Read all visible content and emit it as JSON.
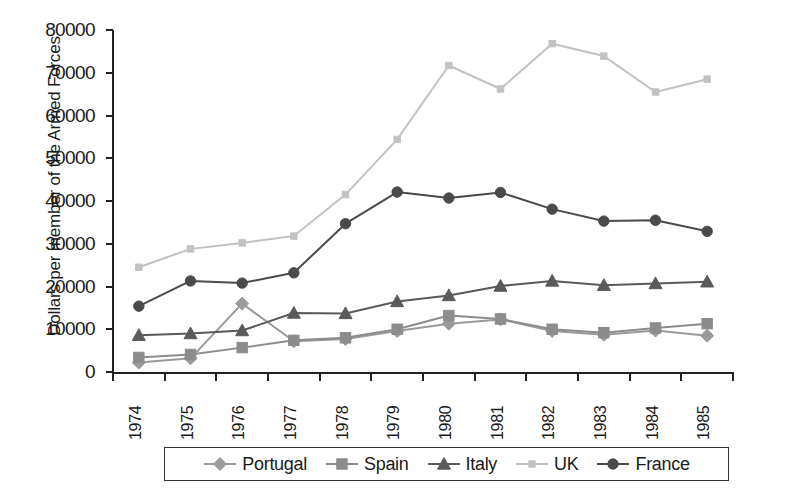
{
  "chart_data": {
    "type": "line",
    "title": "",
    "xlabel": "",
    "ylabel": "Dollars per member of the Armed Forces",
    "categories": [
      "1974",
      "1975",
      "1976",
      "1977",
      "1978",
      "1979",
      "1980",
      "1981",
      "1982",
      "1983",
      "1984",
      "1985"
    ],
    "ylim": [
      0,
      80000
    ],
    "ytick_labels": [
      "80000",
      "70000",
      "60000",
      "50000",
      "40000",
      "30000",
      "20000",
      "10000",
      "0"
    ],
    "ytick_values": [
      80000,
      70000,
      60000,
      50000,
      40000,
      30000,
      20000,
      10000,
      0
    ],
    "grid": false,
    "legend_position": "bottom",
    "series": [
      {
        "name": "Portugal",
        "marker": "diamond",
        "color": "#9a9a9a",
        "values": [
          2200,
          3200,
          16000,
          7200,
          7700,
          9600,
          11300,
          12300,
          9600,
          8700,
          9700,
          8500
        ]
      },
      {
        "name": "Spain",
        "marker": "square",
        "color": "#8c8c8c",
        "values": [
          3400,
          4100,
          5700,
          7400,
          8000,
          10000,
          13200,
          12400,
          10000,
          9200,
          10300,
          11300
        ]
      },
      {
        "name": "Italy",
        "marker": "triangle",
        "color": "#5a5a5a",
        "values": [
          8600,
          9000,
          9700,
          13800,
          13700,
          16500,
          17900,
          20100,
          21300,
          20300,
          20700,
          21100
        ]
      },
      {
        "name": "UK",
        "marker": "square",
        "color": "#c2c2c2",
        "values": [
          24500,
          28800,
          30200,
          31800,
          41500,
          54400,
          71700,
          66200,
          76800,
          73900,
          65500,
          68500
        ]
      },
      {
        "name": "France",
        "marker": "circle",
        "color": "#4a4a4a",
        "values": [
          15400,
          21300,
          20800,
          23200,
          34700,
          42100,
          40700,
          42000,
          38100,
          35300,
          35500,
          32900
        ]
      }
    ]
  },
  "legend": {
    "entries": [
      {
        "label": "Portugal"
      },
      {
        "label": "Spain"
      },
      {
        "label": "Italy"
      },
      {
        "label": "UK"
      },
      {
        "label": "France"
      }
    ]
  }
}
